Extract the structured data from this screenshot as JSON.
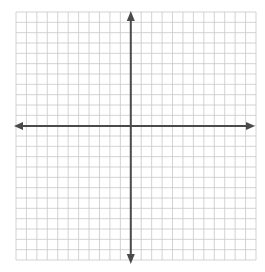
{
  "diagram": {
    "type": "coordinate-plane",
    "grid": {
      "columns": 23,
      "rows": 24,
      "x_cells_left_of_y_axis": 11,
      "y_cells_above_x_axis": 12
    },
    "axes": {
      "x_axis": {
        "arrows": [
          "left",
          "right"
        ]
      },
      "y_axis": {
        "arrows": [
          "up",
          "down"
        ]
      }
    },
    "colors": {
      "grid_line": "#c8c8c8",
      "axis": "#4a4a4a",
      "background": "#ffffff"
    }
  }
}
